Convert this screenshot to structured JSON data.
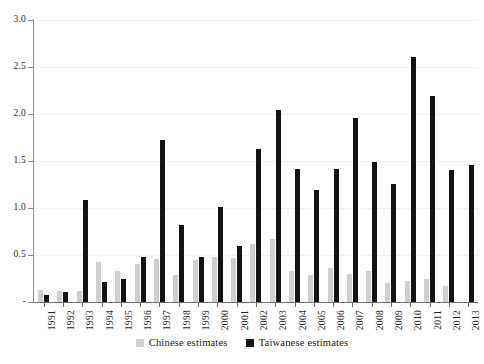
{
  "chart_data": {
    "type": "bar",
    "title": "",
    "xlabel": "",
    "ylabel": "",
    "ylim": [
      0,
      3.0
    ],
    "ytick_labels": [
      "3.0",
      "2.5",
      "2.0",
      "1.5",
      "1.0",
      "0.5",
      "-"
    ],
    "ytick_values": [
      3.0,
      2.5,
      2.0,
      1.5,
      1.0,
      0.5,
      0
    ],
    "grid": true,
    "legend_position": "bottom-center",
    "categories": [
      "1991",
      "1992",
      "1993",
      "1994",
      "1995",
      "1996",
      "1997",
      "1998",
      "1999",
      "2000",
      "2001",
      "2002",
      "2003",
      "2004",
      "2005",
      "2006",
      "2007",
      "2008",
      "2009",
      "2010",
      "2011",
      "2012",
      "2013"
    ],
    "series": [
      {
        "name": "Chinese estimates",
        "color": "#cfcfcf",
        "values": [
          0.13,
          0.12,
          0.12,
          0.43,
          0.33,
          0.4,
          0.46,
          0.29,
          0.45,
          0.48,
          0.47,
          0.62,
          0.67,
          0.33,
          0.29,
          0.36,
          0.3,
          0.33,
          0.2,
          0.22,
          0.24,
          0.17,
          0.0
        ]
      },
      {
        "name": "Taiwanese estimates",
        "color": "#141414",
        "values": [
          0.07,
          0.11,
          1.09,
          0.21,
          0.24,
          0.48,
          1.72,
          0.82,
          0.48,
          1.01,
          0.6,
          1.63,
          2.04,
          1.41,
          1.19,
          1.41,
          1.96,
          1.49,
          1.26,
          2.61,
          2.19,
          1.4,
          1.46
        ]
      }
    ]
  },
  "legend": {
    "items": [
      {
        "label": "Chinese estimates",
        "swatch": "chinese-swatch"
      },
      {
        "label": "Taiwanese estimates",
        "swatch": "taiwanese-swatch"
      }
    ]
  }
}
